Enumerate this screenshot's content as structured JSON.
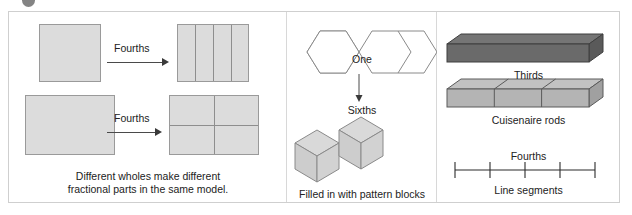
{
  "figure": {
    "corner_marker": "bullet-marker",
    "background": "#ffffff",
    "frame_border_color": "#cfcfcf"
  },
  "panels": {
    "area_models": {
      "name": "area-models",
      "arrow_label_top": "Fourths",
      "arrow_label_bottom": "Fourths",
      "caption_line1": "Different wholes make different",
      "caption_line2": "fractional parts in the same model.",
      "shapes": {
        "whole_square": "square whole",
        "parts_square": "square partitioned into 4 vertical strips",
        "whole_rectangle": "rectangle whole",
        "parts_rectangle": "rectangle partitioned into 4 quadrants"
      },
      "partitions": {
        "square_parts": 4,
        "rectangle_parts": 4
      },
      "fill_color": "#dcdcdc",
      "outline_color": "#9a9a9a"
    },
    "pattern_blocks": {
      "name": "pattern-blocks",
      "whole_label": "One",
      "partition_label": "Sixths",
      "caption": "Filled in with pattern blocks",
      "whole_shape": "two hexagons joined",
      "block_count": 6,
      "block_shape": "rhombus",
      "fill_color": "#d9d9d9",
      "outline_color": "#8a8a8a"
    },
    "rods": {
      "name": "cuisenaire-rods",
      "partition_label": "Thirds",
      "caption": "Cuisenaire rods",
      "whole_rod": "dark single rod",
      "parts_rod": "rod made of 3 equal rods",
      "rod_parts": 3,
      "dark_rod_color": "#6e6e6e",
      "light_rod_color": "#b4b4b4"
    },
    "line_segments": {
      "name": "line-segments",
      "partition_label": "Fourths",
      "caption": "Line segments",
      "tick_count": 5,
      "interval_count": 4,
      "line_color": "#2b2b2b"
    }
  }
}
